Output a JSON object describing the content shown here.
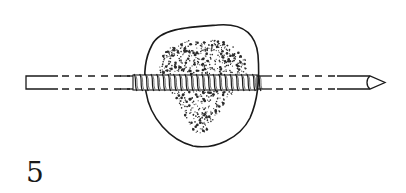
{
  "figure": {
    "label": "5",
    "colors": {
      "line": "#1a1a1a",
      "background": "#ffffff",
      "stipple": "#2a2a2a"
    },
    "rod": {
      "top_y": 76,
      "bottom_y": 89,
      "left_x": 26,
      "tip_start_x": 370,
      "tip_x": 385
    },
    "thread": {
      "start_x": 133,
      "end_x": 257,
      "turns": 22
    },
    "bone_outline": {
      "left_x": 145,
      "right_x": 258,
      "top_y": 24,
      "bottom_y": 148
    }
  }
}
